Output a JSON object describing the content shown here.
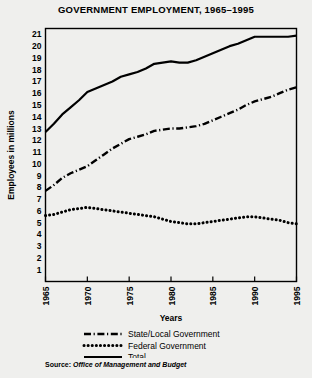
{
  "chart_data": {
    "type": "line",
    "title": "GOVERNMENT EMPLOYMENT, 1965–1995",
    "xlabel": "Years",
    "ylabel": "Employees in millions",
    "xlim": [
      1965,
      1995
    ],
    "ylim": [
      0,
      21.5
    ],
    "ytick_labels": [
      "1",
      "2",
      "3",
      "4",
      "5",
      "6",
      "7",
      "8",
      "9",
      "10",
      "11",
      "12",
      "13",
      "14",
      "15",
      "16",
      "17",
      "18",
      "19",
      "20",
      "21"
    ],
    "ytick_values": [
      1,
      2,
      3,
      4,
      5,
      6,
      7,
      8,
      9,
      10,
      11,
      12,
      13,
      14,
      15,
      16,
      17,
      18,
      19,
      20,
      21
    ],
    "xtick_labels": [
      "1965",
      "1970",
      "1975",
      "1980",
      "1985",
      "1990",
      "1995"
    ],
    "xtick_values": [
      1965,
      1970,
      1975,
      1980,
      1985,
      1990,
      1995
    ],
    "grid": false,
    "legend_position": "below",
    "x": [
      1965,
      1966,
      1967,
      1968,
      1969,
      1970,
      1971,
      1972,
      1973,
      1974,
      1975,
      1976,
      1977,
      1978,
      1979,
      1980,
      1981,
      1982,
      1983,
      1984,
      1985,
      1986,
      1987,
      1988,
      1989,
      1990,
      1991,
      1992,
      1993,
      1994,
      1995
    ],
    "series": [
      {
        "name": "Total",
        "style": "solid",
        "color": "#000000",
        "values": [
          12.7,
          13.4,
          14.2,
          14.8,
          15.4,
          16.1,
          16.4,
          16.7,
          17.0,
          17.4,
          17.6,
          17.8,
          18.1,
          18.5,
          18.6,
          18.7,
          18.6,
          18.6,
          18.8,
          19.1,
          19.4,
          19.7,
          20.0,
          20.2,
          20.5,
          20.8,
          20.8,
          20.8,
          20.8,
          20.8,
          20.9
        ]
      },
      {
        "name": "State/Local Government",
        "style": "dash-dot",
        "color": "#000000",
        "values": [
          7.7,
          8.2,
          8.8,
          9.2,
          9.5,
          9.8,
          10.3,
          10.8,
          11.3,
          11.7,
          12.1,
          12.3,
          12.5,
          12.8,
          12.9,
          13.0,
          13.0,
          13.1,
          13.2,
          13.4,
          13.7,
          14.0,
          14.3,
          14.6,
          15.0,
          15.3,
          15.5,
          15.7,
          16.0,
          16.3,
          16.5
        ]
      },
      {
        "name": "Federal Government",
        "style": "dotted",
        "color": "#000000",
        "values": [
          5.6,
          5.7,
          5.9,
          6.1,
          6.2,
          6.3,
          6.2,
          6.1,
          6.0,
          5.9,
          5.8,
          5.7,
          5.6,
          5.5,
          5.3,
          5.1,
          5.0,
          4.9,
          4.9,
          5.0,
          5.1,
          5.2,
          5.3,
          5.4,
          5.5,
          5.5,
          5.4,
          5.3,
          5.2,
          5.0,
          4.9
        ]
      }
    ]
  },
  "legend": {
    "items": [
      {
        "label": "State/Local Government",
        "style": "dash-dot"
      },
      {
        "label": "Federal Government",
        "style": "dotted"
      },
      {
        "label": "Total",
        "style": "solid"
      }
    ]
  },
  "source": {
    "prefix": "Source:",
    "body": "Office of Management and Budget"
  }
}
